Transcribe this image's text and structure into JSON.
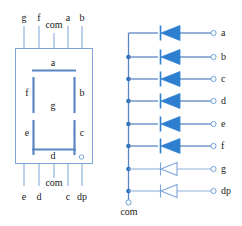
{
  "diagram": {
    "colors": {
      "line": "#5b86c4",
      "segment": "#5b86c4",
      "diode_fill": "#2f7fd1",
      "diode_outline": "#6f9fd8",
      "package_border": "#6f9fd8",
      "text": "#1a1a1a",
      "bus": "#5b86c4",
      "node": "#2f6fb5"
    }
  },
  "package": {
    "name": "seven-segment-display-package",
    "top_pins": [
      {
        "label": "g",
        "x": 24
      },
      {
        "label": "f",
        "x": 39
      },
      {
        "label": "com",
        "x": 54
      },
      {
        "label": "a",
        "x": 68
      },
      {
        "label": "b",
        "x": 82
      }
    ],
    "bottom_pins": [
      {
        "label": "e",
        "x": 24
      },
      {
        "label": "d",
        "x": 39
      },
      {
        "label": "com",
        "x": 54
      },
      {
        "label": "c",
        "x": 68
      },
      {
        "label": "dp",
        "x": 82
      }
    ],
    "segment_labels": [
      {
        "id": "a",
        "label": "a",
        "x": 53,
        "y": 63
      },
      {
        "id": "f",
        "label": "f",
        "x": 27,
        "y": 100
      },
      {
        "id": "b",
        "label": "b",
        "x": 80,
        "y": 100
      },
      {
        "id": "g",
        "label": "g",
        "x": 53,
        "y": 106
      },
      {
        "id": "e",
        "label": "e",
        "x": 27,
        "y": 134
      },
      {
        "id": "c",
        "label": "c",
        "x": 80,
        "y": 134
      },
      {
        "id": "d",
        "label": "d",
        "x": 53,
        "y": 152
      }
    ],
    "decimal_point": {
      "label": "dp-dot"
    }
  },
  "circuit": {
    "name": "diode-ladder-equivalent-circuit",
    "common_terminal_label": "com",
    "rows": [
      {
        "label": "a",
        "y": 33,
        "diode_filled": true
      },
      {
        "label": "b",
        "y": 57,
        "diode_filled": true
      },
      {
        "label": "c",
        "y": 79,
        "diode_filled": true
      },
      {
        "label": "d",
        "y": 101,
        "diode_filled": true
      },
      {
        "label": "e",
        "y": 124,
        "diode_filled": true
      },
      {
        "label": "f",
        "y": 146,
        "diode_filled": true
      },
      {
        "label": "g",
        "y": 169,
        "diode_filled": false
      },
      {
        "label": "dp",
        "y": 191,
        "diode_filled": false
      }
    ]
  }
}
